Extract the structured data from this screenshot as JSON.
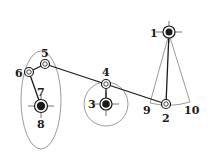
{
  "diagram": {
    "type": "mechanism linkage",
    "colors": {
      "line": "#1a1a1a",
      "dashed": "#555555",
      "background": "#ffffff"
    },
    "labels": [
      {
        "id": "1",
        "text": "1",
        "x": 150,
        "y": 37
      },
      {
        "id": "2",
        "text": "2",
        "x": 162,
        "y": 122
      },
      {
        "id": "3",
        "text": "3",
        "x": 88,
        "y": 108
      },
      {
        "id": "4",
        "text": "4",
        "x": 102,
        "y": 76
      },
      {
        "id": "5",
        "text": "5",
        "x": 41,
        "y": 57
      },
      {
        "id": "6",
        "text": "6",
        "x": 15,
        "y": 77
      },
      {
        "id": "7",
        "text": "7",
        "x": 37,
        "y": 96
      },
      {
        "id": "8",
        "text": "8",
        "x": 37,
        "y": 128
      },
      {
        "id": "9",
        "text": "9",
        "x": 143,
        "y": 114
      },
      {
        "id": "10",
        "text": "10",
        "x": 184,
        "y": 114
      }
    ]
  }
}
